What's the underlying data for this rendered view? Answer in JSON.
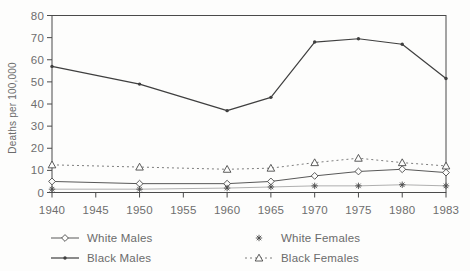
{
  "colors": {
    "background": "#fdfdfc",
    "frame": "#4a4a4a",
    "tick_text": "#6e6e6e",
    "ink_dark": "#3f3f3f",
    "ink_mid": "#585858",
    "ink_dashed": "#6e6e6e",
    "ink_faint": "#9b9b9b",
    "marker_stroke": "#4a4a4a",
    "marker_fill": "#fdfdfc"
  },
  "chart_data": {
    "type": "line",
    "title": "",
    "xlabel": "",
    "ylabel": "Deaths per 100,000",
    "grid": false,
    "legend_position": "bottom",
    "ylim": [
      0,
      80
    ],
    "y_tick_labels": [
      "0",
      "10",
      "20",
      "30",
      "40",
      "50",
      "60",
      "70",
      "80"
    ],
    "x_tick_labels": [
      "1940",
      "1945",
      "1950",
      "1955",
      "1960",
      "1965",
      "1970",
      "1975",
      "1980",
      "1983"
    ],
    "categories": [
      1940,
      1950,
      1960,
      1965,
      1970,
      1975,
      1980,
      1983
    ],
    "x_tick_index": [
      0,
      2,
      4,
      5,
      6,
      7,
      8,
      9
    ],
    "series": [
      {
        "name": "White Males",
        "marker": "diamond",
        "line": "solid",
        "legend_line": true,
        "legend_column": "left",
        "values": [
          5,
          4,
          4,
          5,
          7.5,
          9.5,
          10.5,
          9
        ]
      },
      {
        "name": "Black Males",
        "marker": "dot",
        "line": "solid",
        "legend_line": true,
        "legend_column": "left",
        "values": [
          57,
          49,
          37,
          43,
          68,
          69.5,
          67,
          51.5
        ]
      },
      {
        "name": "White Females",
        "marker": "asterisk",
        "line": "faint",
        "legend_line": false,
        "legend_column": "right",
        "values": [
          1.5,
          1.5,
          2,
          2.5,
          3,
          3,
          3.5,
          3
        ]
      },
      {
        "name": "Black Females",
        "marker": "triangle",
        "line": "dashed",
        "legend_line": true,
        "legend_column": "right",
        "values": [
          12.5,
          11.5,
          10.5,
          11,
          13.5,
          15.5,
          13.5,
          12
        ]
      }
    ]
  }
}
